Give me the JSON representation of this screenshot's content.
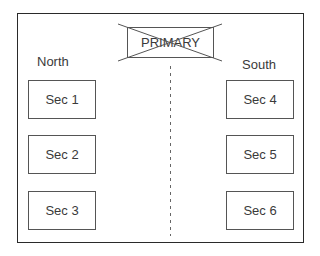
{
  "diagram": {
    "primary": {
      "label": "PRIMARY",
      "crossed_out": true
    },
    "north": {
      "label": "North",
      "sections": [
        {
          "label": "Sec 1"
        },
        {
          "label": "Sec 2"
        },
        {
          "label": "Sec 3"
        }
      ]
    },
    "south": {
      "label": "South",
      "sections": [
        {
          "label": "Sec 4"
        },
        {
          "label": "Sec 5"
        },
        {
          "label": "Sec 6"
        }
      ]
    },
    "divider": {
      "style": "dashed"
    }
  },
  "colors": {
    "border": "#2a2a2a",
    "box_border": "#555555",
    "text": "#3a3a3a",
    "background": "#ffffff"
  }
}
